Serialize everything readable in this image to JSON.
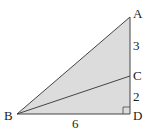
{
  "diagram": {
    "type": "right-triangle",
    "fill_color": "#dcdcdc",
    "stroke_color": "#444444",
    "vertices": {
      "A": {
        "label": "A",
        "x": 130,
        "y": 17
      },
      "B": {
        "label": "B",
        "x": 17,
        "y": 114
      },
      "C": {
        "label": "C",
        "x": 130,
        "y": 76
      },
      "D": {
        "label": "D",
        "x": 130,
        "y": 114
      }
    },
    "segments": [
      {
        "from": "A",
        "to": "B"
      },
      {
        "from": "B",
        "to": "D"
      },
      {
        "from": "D",
        "to": "A"
      },
      {
        "from": "B",
        "to": "C"
      }
    ],
    "right_angle_at": "D",
    "measurements": {
      "AC": "3",
      "CD": "2",
      "BD": "6"
    }
  }
}
